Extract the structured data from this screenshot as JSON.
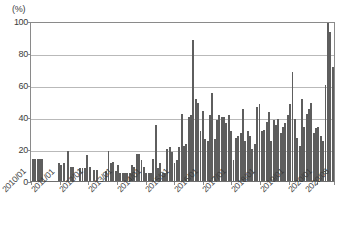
{
  "chart_data": {
    "type": "bar",
    "title": "",
    "subtitle": "",
    "xlabel": "",
    "ylabel": "",
    "unit_label": "(%)",
    "ylim": [
      0,
      100
    ],
    "ytick_values": [
      100,
      80,
      60,
      40,
      20,
      0
    ],
    "ytick_labels": [
      "100",
      "80",
      "60",
      "40",
      "20",
      "0"
    ],
    "grid": true,
    "grid_axis": "y",
    "legend": "none",
    "bar_color": "#5e5e5e",
    "axis_color": "#8a8a8a",
    "grid_color": "#b9b9b9",
    "x_start": "2010/01",
    "x_end": "2020/08",
    "x_tick_labels": [
      "2010/01",
      "2011/01",
      "2012/01",
      "2013/01",
      "2014/01",
      "2015/01",
      "2016/01",
      "2017/01",
      "2018/01",
      "2019/01",
      "2020/01",
      "2020/08"
    ],
    "x_tick_indices": [
      0,
      12,
      24,
      36,
      48,
      60,
      72,
      84,
      96,
      108,
      120,
      127
    ],
    "categories": [
      "2010/01",
      "2010/02",
      "2010/03",
      "2010/04",
      "2010/05",
      "2010/06",
      "2010/07",
      "2010/08",
      "2010/09",
      "2010/10",
      "2010/11",
      "2010/12",
      "2011/01",
      "2011/02",
      "2011/03",
      "2011/04",
      "2011/05",
      "2011/06",
      "2011/07",
      "2011/08",
      "2011/09",
      "2011/10",
      "2011/11",
      "2011/12",
      "2012/01",
      "2012/02",
      "2012/03",
      "2012/04",
      "2012/05",
      "2012/06",
      "2012/07",
      "2012/08",
      "2012/09",
      "2012/10",
      "2012/11",
      "2012/12",
      "2013/01",
      "2013/02",
      "2013/03",
      "2013/04",
      "2013/05",
      "2013/06",
      "2013/07",
      "2013/08",
      "2013/09",
      "2013/10",
      "2013/11",
      "2013/12",
      "2014/01",
      "2014/02",
      "2014/03",
      "2014/04",
      "2014/05",
      "2014/06",
      "2014/07",
      "2014/08",
      "2014/09",
      "2014/10",
      "2014/11",
      "2014/12",
      "2015/01",
      "2015/02",
      "2015/03",
      "2015/04",
      "2015/05",
      "2015/06",
      "2015/07",
      "2015/08",
      "2015/09",
      "2015/10",
      "2015/11",
      "2015/12",
      "2016/01",
      "2016/02",
      "2016/03",
      "2016/04",
      "2016/05",
      "2016/06",
      "2016/07",
      "2016/08",
      "2016/09",
      "2016/10",
      "2016/11",
      "2016/12",
      "2017/01",
      "2017/02",
      "2017/03",
      "2017/04",
      "2017/05",
      "2017/06",
      "2017/07",
      "2017/08",
      "2017/09",
      "2017/10",
      "2017/11",
      "2017/12",
      "2018/01",
      "2018/02",
      "2018/03",
      "2018/04",
      "2018/05",
      "2018/06",
      "2018/07",
      "2018/08",
      "2018/09",
      "2018/10",
      "2018/11",
      "2018/12",
      "2019/01",
      "2019/02",
      "2019/03",
      "2019/04",
      "2019/05",
      "2019/06",
      "2019/07",
      "2019/08",
      "2019/09",
      "2019/10",
      "2019/11",
      "2019/12",
      "2020/01",
      "2020/02",
      "2020/03",
      "2020/04",
      "2020/05",
      "2020/06",
      "2020/07",
      "2020/08"
    ],
    "values": [
      14,
      14,
      14,
      14,
      14,
      0,
      0,
      0,
      0,
      0,
      0,
      11,
      10,
      11,
      0,
      19,
      9,
      9,
      0,
      0,
      8,
      8,
      8,
      16,
      9,
      0,
      7,
      7,
      0,
      0,
      0,
      6,
      19,
      11,
      12,
      6,
      10,
      5,
      5,
      5,
      5,
      5,
      10,
      9,
      17,
      17,
      13,
      9,
      5,
      5,
      5,
      14,
      35,
      8,
      11,
      5,
      5,
      20,
      21,
      18,
      11,
      13,
      21,
      42,
      22,
      23,
      40,
      41,
      88,
      51,
      49,
      31,
      44,
      26,
      25,
      41,
      55,
      26,
      38,
      41,
      40,
      40,
      36,
      41,
      31,
      13,
      27,
      28,
      30,
      45,
      25,
      31,
      28,
      20,
      23,
      46,
      48,
      31,
      32,
      37,
      43,
      25,
      38,
      35,
      39,
      30,
      34,
      36,
      41,
      48,
      68,
      39,
      27,
      22,
      51,
      34,
      42,
      45,
      49,
      30,
      33,
      34,
      28,
      25,
      60,
      101,
      93,
      71
    ]
  }
}
